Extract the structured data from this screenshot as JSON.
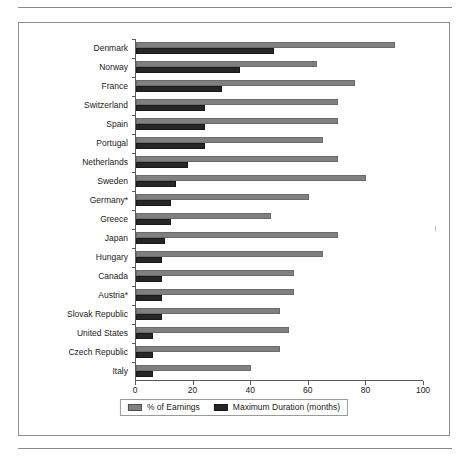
{
  "chart_data": {
    "type": "bar",
    "orientation": "horizontal",
    "title": "",
    "xlabel": "",
    "ylabel": "",
    "xlim": [
      0,
      100
    ],
    "xticks": [
      0,
      20,
      40,
      60,
      80,
      100
    ],
    "grid": false,
    "legend_position": "bottom",
    "categories": [
      "Denmark",
      "Norway",
      "France",
      "Switzerland",
      "Spain",
      "Portugal",
      "Netherlands",
      "Sweden",
      "Germany*",
      "Greece",
      "Japan",
      "Hungary",
      "Canada",
      "Austria*",
      "Slovak Republic",
      "United States",
      "Czech Republic",
      "Italy"
    ],
    "series": [
      {
        "name": "% of Earnings",
        "color": "#808080",
        "values": [
          90,
          63,
          76,
          70,
          70,
          65,
          70,
          80,
          60,
          47,
          70,
          65,
          55,
          55,
          50,
          53,
          50,
          40
        ]
      },
      {
        "name": "Maximum Duration (months)",
        "color": "#262626",
        "values": [
          48,
          36,
          30,
          24,
          24,
          24,
          18,
          14,
          12,
          12,
          10,
          9,
          9,
          9,
          9,
          6,
          6,
          6
        ]
      }
    ]
  },
  "legend": {
    "entries": [
      {
        "label": "% of Earnings"
      },
      {
        "label": "Maximum Duration (months)"
      }
    ]
  }
}
